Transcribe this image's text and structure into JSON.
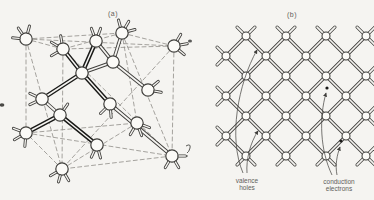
{
  "labels": {
    "panel_a": "(a)",
    "panel_b": "(b)"
  },
  "annotations": {
    "valence_line1": "valence",
    "valence_line2": "holes",
    "conduction_line1": "conduction",
    "conduction_line2": "electrons"
  },
  "colors": {
    "paper": "#f5f4f1",
    "ink": "#3f3e3b",
    "ink_bold": "#1a1a18",
    "dash": "#8f8d88",
    "text": "#5f5e5a"
  }
}
